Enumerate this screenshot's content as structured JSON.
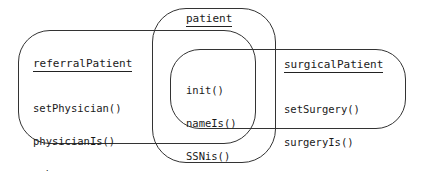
{
  "diagram": {
    "sets": [
      {
        "id": "patient",
        "title": "patient",
        "members": [
          "init()",
          "nameIs()",
          "SSNis()",
          "name",
          "ssn"
        ]
      },
      {
        "id": "referralPatient",
        "title": "referralPatient",
        "members": [
          "setPhysician()",
          "physicianIs()",
          "rphys"
        ]
      },
      {
        "id": "surgicalPatient",
        "title": "surgicalPatient",
        "members": [
          "setSurgery()",
          "surgeryIs()",
          "surgery"
        ]
      }
    ],
    "colors": {
      "stroke": "#333333",
      "text": "#1a1a1a",
      "background": "#ffffff"
    }
  }
}
